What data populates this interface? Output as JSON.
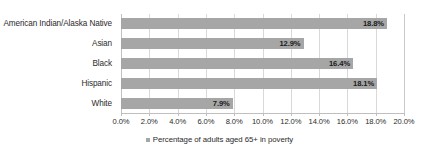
{
  "chart_data": {
    "type": "bar",
    "orientation": "horizontal",
    "title": "",
    "xlabel": "",
    "ylabel": "",
    "categories": [
      "American Indian/Alaska Native",
      "Asian",
      "Black",
      "Hispanic",
      "White"
    ],
    "values": [
      18.8,
      12.9,
      16.4,
      18.1,
      7.9
    ],
    "value_labels": [
      "18.8%",
      "12.9%",
      "16.4%",
      "18.1%",
      "7.9%"
    ],
    "series": [
      {
        "name": "Percentage of adults aged 65+ in poverty",
        "values": [
          18.8,
          12.9,
          16.4,
          18.1,
          7.9
        ]
      }
    ],
    "xlim": [
      0,
      20
    ],
    "xtick_values": [
      0,
      2,
      4,
      6,
      8,
      10,
      12,
      14,
      16,
      18,
      20
    ],
    "xtick_labels": [
      "0.0%",
      "2.0%",
      "4.0%",
      "6.0%",
      "8.0%",
      "10.0%",
      "12.0%",
      "14.0%",
      "16.0%",
      "18.0%",
      "20.0%"
    ],
    "grid": true,
    "grid_axis": "x",
    "legend": {
      "position": "bottom",
      "entries": [
        {
          "label": "Percentage of adults aged 65+ in poverty",
          "color": "#a6a6a6"
        }
      ]
    },
    "colors": {
      "bar": "#a6a6a6",
      "gridline": "#d9d9d9",
      "axis": "#bfbfbf",
      "text": "#2b2b2b",
      "value_label": "#1a1a1a",
      "background": "#ffffff"
    }
  }
}
